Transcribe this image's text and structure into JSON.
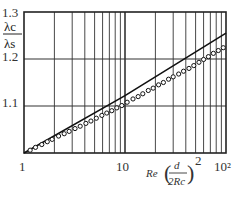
{
  "chart_data": {
    "type": "scatter",
    "title": "",
    "xlabel": "Re(d/2Rc)^2",
    "xlabel_parts": {
      "re": "Re",
      "num": "d",
      "den": "2Rc",
      "exp": "2"
    },
    "ylabel": "λc / λs",
    "ylabel_parts": {
      "num": "λc",
      "den": "λs"
    },
    "xscale": "log",
    "xlim": [
      1,
      100
    ],
    "ylim": [
      1.0,
      1.3
    ],
    "grid": true,
    "x_ticks": [
      {
        "value": 1,
        "label": "1"
      },
      {
        "value": 10,
        "label": "10"
      },
      {
        "value": 100,
        "label": "10²"
      }
    ],
    "y_ticks": [
      {
        "value": 1.1,
        "label": "1.1"
      },
      {
        "value": 1.2,
        "label": "1.2"
      },
      {
        "value": 1.3,
        "label": "1.3"
      }
    ],
    "series": [
      {
        "name": "fit line",
        "style": "line",
        "x": [
          1,
          10,
          100
        ],
        "y": [
          1.0,
          1.122,
          1.255
        ]
      },
      {
        "name": "experimental data",
        "style": "open-circle markers",
        "x": [
          1.15,
          1.3,
          1.5,
          1.7,
          1.9,
          2.2,
          2.5,
          2.8,
          3.2,
          3.6,
          4.1,
          4.6,
          5.2,
          5.9,
          6.6,
          7.4,
          8.3,
          9.3,
          10.5,
          12,
          13.5,
          15,
          17,
          19,
          21.5,
          24,
          27,
          30,
          34,
          38,
          43,
          48,
          54,
          60,
          67,
          75,
          84,
          94
        ],
        "y": [
          1.006,
          1.012,
          1.018,
          1.024,
          1.029,
          1.036,
          1.041,
          1.046,
          1.052,
          1.057,
          1.063,
          1.068,
          1.074,
          1.08,
          1.085,
          1.09,
          1.096,
          1.101,
          1.108,
          1.115,
          1.12,
          1.126,
          1.133,
          1.138,
          1.145,
          1.15,
          1.157,
          1.162,
          1.168,
          1.174,
          1.18,
          1.186,
          1.193,
          1.199,
          1.205,
          1.212,
          1.218,
          1.224
        ]
      }
    ]
  }
}
